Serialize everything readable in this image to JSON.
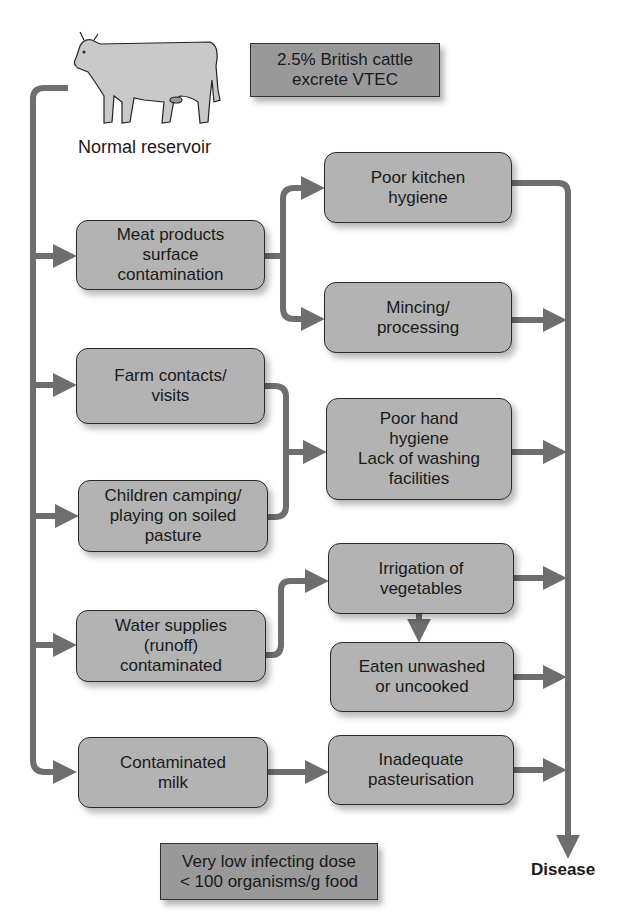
{
  "reservoir": {
    "label": "Normal reservoir",
    "icon": "cow-icon"
  },
  "notes": {
    "british": "2.5% British cattle\nexcrete VTEC",
    "dose": "Very low infecting dose\n< 100 organisms/g food"
  },
  "sources": [
    {
      "id": "meat",
      "label": "Meat products\nsurface\ncontamination"
    },
    {
      "id": "farm",
      "label": "Farm contacts/\nvisits"
    },
    {
      "id": "children",
      "label": "Children camping/\nplaying on soiled\npasture"
    },
    {
      "id": "water",
      "label": "Water supplies\n(runoff)\ncontaminated"
    },
    {
      "id": "milk",
      "label": "Contaminated\nmilk"
    }
  ],
  "routes": [
    {
      "id": "kitchen",
      "label": "Poor kitchen\nhygiene"
    },
    {
      "id": "mincing",
      "label": "Mincing/\nprocessing"
    },
    {
      "id": "hand",
      "label": "Poor hand\nhygiene\nLack of washing\nfacilities"
    },
    {
      "id": "irrigation",
      "label": "Irrigation of\nvegetables"
    },
    {
      "id": "eaten",
      "label": "Eaten unwashed\nor uncooked"
    },
    {
      "id": "pasteurisation",
      "label": "Inadequate\npasteurisation"
    }
  ],
  "outcome": {
    "label": "Disease"
  },
  "colors": {
    "box_fill": "#b3b3b3",
    "note_fill": "#999999",
    "arrow": "#6e6e6e",
    "border": "#2a2a2a"
  }
}
